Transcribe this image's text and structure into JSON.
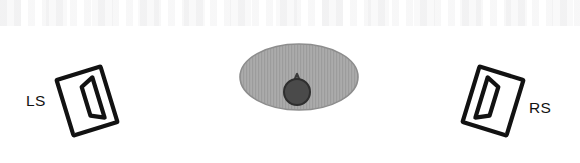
{
  "figure": {
    "background_color": "#ffffff"
  },
  "labels": {
    "left_speaker": "LS",
    "right_speaker": "RS"
  },
  "colors": {
    "ink": "#121212",
    "speaker_fill": "#ffffff",
    "listening_area_fill": "#a8a8a8",
    "listening_area_stroke": "#8d8d8d",
    "head_fill": "#4a4a4a",
    "head_stroke": "#2e2e2e"
  },
  "elements": {
    "left_speaker": {
      "name": "left-speaker-icon",
      "label": "LS",
      "rotation_deg": -17,
      "center_x": 87,
      "center_y": 101
    },
    "right_speaker": {
      "name": "right-speaker-icon",
      "label": "RS",
      "rotation_deg": 17,
      "center_x": 493,
      "center_y": 101
    },
    "listening_area": {
      "name": "listening-area-ellipse",
      "center_x": 299,
      "center_y": 77,
      "radius_x": 59,
      "radius_y": 33
    },
    "listener_head": {
      "name": "listener-head-icon",
      "center_x": 297,
      "center_y": 92,
      "radius": 13
    }
  }
}
